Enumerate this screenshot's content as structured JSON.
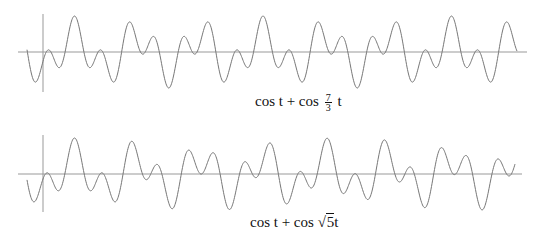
{
  "chart_data": [
    {
      "type": "line",
      "title": "cos t + cos (7/3) t",
      "function": "cos(t) + cos(7/3 * t)",
      "k": 2.3333333,
      "xlabel": "",
      "ylabel": "",
      "ylim": [
        -2,
        2
      ],
      "grid": false,
      "legend": "none",
      "axis_y_px": 52,
      "axis_x_px": 43,
      "t_offset": -3.15
    },
    {
      "type": "line",
      "title": "cos t + cos √5 t",
      "function": "cos(t) + cos(sqrt(5) * t)",
      "k": 2.236068,
      "xlabel": "",
      "ylabel": "",
      "ylim": [
        -2,
        2
      ],
      "grid": false,
      "legend": "none",
      "axis_y_px": 174,
      "axis_x_px": 43,
      "t_offset": -3.15
    }
  ],
  "captions": {
    "top": {
      "pre": "cos t + cos ",
      "num": "7",
      "den": "3",
      "post": " t"
    },
    "bottom": {
      "pre": "cos t + cos ",
      "rad": "5",
      "post": "t"
    }
  },
  "colors": {
    "curve": "#777777",
    "axis": "#999999"
  }
}
